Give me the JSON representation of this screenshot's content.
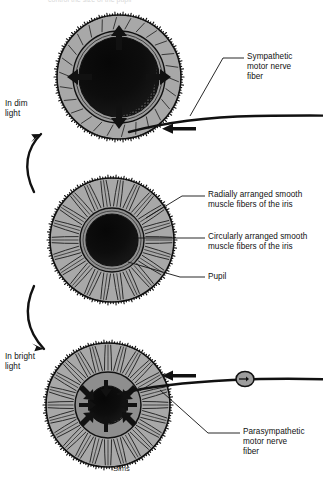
{
  "figure": {
    "title_cropped": "control the size of the pupil",
    "signature": "Sims",
    "background_color": "#ffffff",
    "ink_color": "#111111",
    "iris_fill_color": "#a8a8a8",
    "inner_ring_color": "#8f8f8f",
    "pupil_color": "#101010"
  },
  "state_labels": {
    "dim": "In dim\nlight",
    "bright": "In bright\nlight"
  },
  "callouts": {
    "sympathetic": "Sympathetic\nmotor nerve\nfiber",
    "radial": "Radially arranged smooth\nmuscle fibers of the iris",
    "circular": "Circularly arranged smooth\nmuscle fibers of the iris",
    "pupil": "Pupil",
    "parasympathetic": "Parasympathetic\nmotor nerve\nfiber"
  },
  "diagrams": [
    {
      "id": "iris-dilated",
      "state": "dilated",
      "condition": "In dim light",
      "center": [
        119,
        77
      ],
      "outer_radius": 62,
      "pupil_radius": 40,
      "arrow_direction": "outward",
      "arrow_count": 4,
      "innervation": "sympathetic"
    },
    {
      "id": "iris-neutral",
      "state": "neutral",
      "condition": "reference",
      "center": [
        112,
        240
      ],
      "outer_radius": 62,
      "pupil_radius": 26,
      "arrow_direction": "none",
      "arrow_count": 0,
      "innervation": "none"
    },
    {
      "id": "iris-constricted",
      "state": "constricted",
      "condition": "In bright light",
      "center": [
        108,
        405
      ],
      "outer_radius": 62,
      "pupil_radius": 19,
      "arrow_direction": "inward",
      "arrow_count": 4,
      "innervation": "parasympathetic"
    }
  ],
  "nerves": [
    {
      "id": "sympathetic-fiber",
      "label": "Sympathetic motor nerve fiber",
      "flow_arrow": "left",
      "has_ganglion": false
    },
    {
      "id": "parasympathetic-fiber",
      "label": "Parasympathetic motor nerve fiber",
      "flow_arrow": "left",
      "has_ganglion": true
    }
  ],
  "transitions": [
    {
      "id": "to-dim",
      "from": "iris-neutral",
      "to": "iris-dilated",
      "direction": "up"
    },
    {
      "id": "to-bright",
      "from": "iris-neutral",
      "to": "iris-constricted",
      "direction": "down"
    }
  ]
}
